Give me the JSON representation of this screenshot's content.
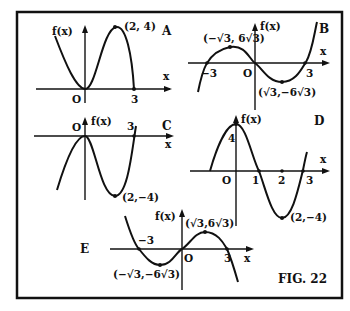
{
  "figure": {
    "caption": "FIG. 22",
    "panels": [
      {
        "id": "A",
        "y_axis_label": "f(x)",
        "x_axis_label": "x",
        "origin_label": "O",
        "x_tick": "3",
        "point_label": "(2, 4)"
      },
      {
        "id": "B",
        "y_axis_label": "f(x)",
        "x_axis_label": "x",
        "origin_label": "O",
        "x_tick_neg": "−3",
        "x_tick_pos": "3",
        "max_label": "(−√3, 6√3)",
        "min_label": "(√3,−6√3)"
      },
      {
        "id": "C",
        "y_axis_label": "f(x)",
        "x_axis_label": "x",
        "origin_label": "O",
        "x_tick": "3",
        "point_label": "(2,−4)"
      },
      {
        "id": "D",
        "y_axis_label": "f(x)",
        "x_axis_label": "x",
        "origin_label": "O",
        "y_tick": "4",
        "x_tick_1": "1",
        "x_tick_2": "2",
        "x_tick_3": "3",
        "point_label": "(2,−4)"
      },
      {
        "id": "E",
        "y_axis_label": "f(x)",
        "x_axis_label": "x",
        "origin_label": "O",
        "x_tick_neg": "−3",
        "x_tick_pos": "3",
        "max_label": "(√3,6√3)",
        "min_label": "(−√3,−6√3)"
      }
    ]
  }
}
